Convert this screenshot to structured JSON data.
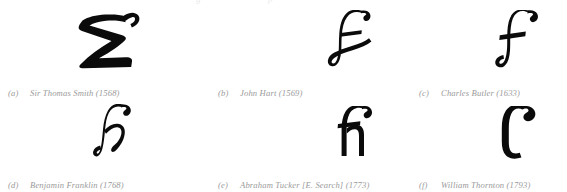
{
  "figure": {
    "top_crop_remnant": [
      "g",
      "p"
    ],
    "rows": [
      {
        "row_name": "top-row",
        "items": [
          {
            "label": "(a)",
            "text": "Sir Thomas Smith (1568)",
            "author": "Sir Thomas Smith",
            "year": "1568",
            "glyph_name": "smith-sh-glyph"
          },
          {
            "label": "(b)",
            "text": "John Hart (1569)",
            "author": "John Hart",
            "year": "1569",
            "glyph_name": "hart-sh-glyph"
          },
          {
            "label": "(c)",
            "text": "Charles Butler (1633)",
            "author": "Charles Butler",
            "year": "1633",
            "glyph_name": "butler-sh-glyph"
          }
        ]
      },
      {
        "row_name": "bottom-row",
        "items": [
          {
            "label": "(d)",
            "text": "Benjamin Franklin (1768)",
            "author": "Benjamin Franklin",
            "year": "1768",
            "glyph_name": "franklin-ish-glyph"
          },
          {
            "label": "(e)",
            "text": "Abraham Tucker [E. Search] (1773)",
            "author": "Abraham Tucker [E. Search]",
            "year": "1773",
            "glyph_name": "tucker-sh-glyph"
          },
          {
            "label": "(f)",
            "text": "William Thornton (1793)",
            "author": "William Thornton",
            "year": "1793",
            "glyph_name": "thornton-sh-glyph"
          }
        ]
      }
    ]
  },
  "colors": {
    "background": "#ffffff",
    "glyph_ink": "#0b0b0b",
    "caption_text": "#9a9a9a"
  }
}
